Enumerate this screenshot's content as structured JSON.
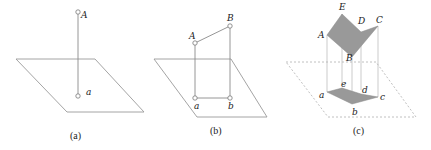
{
  "figure": {
    "panels": [
      {
        "id": "a",
        "caption": "(a)",
        "labels": {
          "upper": "A",
          "lower": "a"
        },
        "description": "Point A projected perpendicularly onto plane as point a"
      },
      {
        "id": "b",
        "caption": "(b)",
        "labels": {
          "upper": [
            "A",
            "B"
          ],
          "lower": [
            "a",
            "b"
          ]
        },
        "description": "Segment AB projected perpendicularly onto plane as segment ab"
      },
      {
        "id": "c",
        "caption": "(c)",
        "labels": {
          "upper": [
            "A",
            "B",
            "C",
            "D",
            "E"
          ],
          "lower": [
            "a",
            "b",
            "c",
            "d",
            "e"
          ]
        },
        "description": "Polygon ABCDE projected onto plane as polygon abcde"
      }
    ],
    "colors": {
      "plane_stroke": "#9a9a9a",
      "shape_fill": "#999999",
      "background": "#ffffff"
    }
  }
}
